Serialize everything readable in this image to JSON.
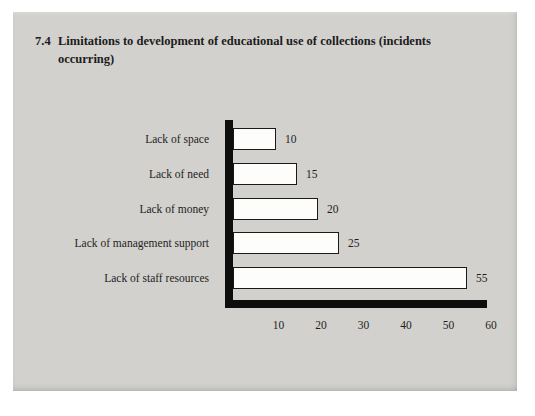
{
  "figure": {
    "number": "7.4",
    "title": "Limitations to development of educational use of collections (incidents occurring)"
  },
  "chart_data": {
    "type": "bar",
    "orientation": "horizontal",
    "title": "7.4 Limitations to development of educational use of collections (incidents occurring)",
    "categories": [
      "Lack of space",
      "Lack of need",
      "Lack of money",
      "Lack of management support",
      "Lack of staff resources"
    ],
    "values": [
      10,
      15,
      20,
      25,
      55
    ],
    "x_ticks": [
      10,
      20,
      30,
      40,
      50,
      60
    ],
    "xlim": [
      0,
      62
    ],
    "xlabel": "",
    "ylabel": "",
    "legend": "none",
    "grid": "off",
    "colors": {
      "panel_bg": "#d2d1cd",
      "page_bg": "#ffffff",
      "bar_fill": "#fdfdfc",
      "bar_border": "#1a1a1a",
      "axis": "#0e0e0e",
      "text": "#1c1c1c"
    }
  }
}
